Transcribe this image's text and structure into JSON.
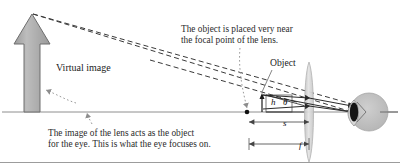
{
  "figure": {
    "background": "#ffffff",
    "width": 400,
    "height": 163
  },
  "annotations": {
    "focal_note": "The object is placed very near\nthe focal point of the lens.",
    "bottom_note": "The image of the lens acts as the object\nfor the eye. This is what the eye focuses on."
  },
  "labels": {
    "virtual_image": "Virtual image",
    "object": "Object",
    "height_symbol": "h",
    "angle_symbol": "θ",
    "object_distance_symbol": "s",
    "focal_length_symbol": "f"
  },
  "colors": {
    "arrow_fill": "#a8a8a8",
    "arrow_stroke": "#6e6e6e",
    "lens_fill": "#d2d2d2",
    "lens_stroke": "#b4b4b4",
    "eye_fill": "#c0c0c0",
    "eye_stroke": "#a0a0a0",
    "pupil_fill": "#1a1a1a",
    "axis_stroke": "#909090",
    "ray_stroke": "#2a2a2a",
    "dashed_stroke": "#3a3a3a",
    "leader_stroke": "#9a9a9a",
    "text": "#2b2b2b",
    "border": "#9c9c9c"
  },
  "optics": {
    "axis_y": 112,
    "lens_x": 309,
    "object_x": 262,
    "object_height": 14,
    "eye_x": 357,
    "virtual_image_x": 32,
    "virtual_image_top_y": 14,
    "focal_point_x": 247,
    "dimension_s": {
      "from_x": 249,
      "to_x": 309,
      "y": 122
    },
    "dimension_f": {
      "from_x": 249,
      "to_x": 309,
      "y": 144
    }
  }
}
